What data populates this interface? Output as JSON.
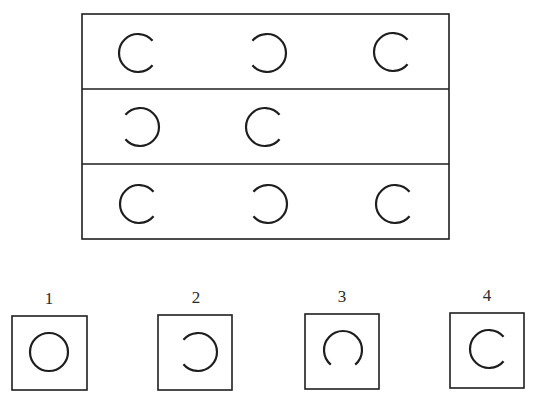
{
  "puzzle": {
    "type": "matrix-completion",
    "stroke_color": "#1e1e1e",
    "background": "#ffffff",
    "matrix": {
      "box": {
        "x": 82,
        "y": 14,
        "width": 367,
        "height": 225
      },
      "dividers_y": [
        89,
        164
      ],
      "rows": [
        {
          "cells": [
            {
              "shape": "circle-open-right",
              "cx": 138,
              "cy": 53,
              "r": 19
            },
            {
              "shape": "circle-open-left",
              "cx": 267,
              "cy": 53,
              "r": 19
            },
            {
              "shape": "circle-open-right",
              "cx": 393,
              "cy": 52,
              "r": 19
            }
          ]
        },
        {
          "cells": [
            {
              "shape": "circle-open-left",
              "cx": 140,
              "cy": 127,
              "r": 19
            },
            {
              "shape": "circle-open-right",
              "cx": 265,
              "cy": 127,
              "r": 19
            },
            {
              "shape": "empty",
              "cx": 393,
              "cy": 127,
              "r": 19
            }
          ]
        },
        {
          "cells": [
            {
              "shape": "circle-open-right",
              "cx": 139,
              "cy": 204,
              "r": 19
            },
            {
              "shape": "circle-open-left",
              "cx": 268,
              "cy": 204,
              "r": 19
            },
            {
              "shape": "circle-open-right",
              "cx": 395,
              "cy": 204,
              "r": 19
            }
          ]
        }
      ]
    },
    "options": [
      {
        "label": "1",
        "shape": "circle-closed",
        "box": {
          "x": 12,
          "y": 316,
          "width": 75,
          "height": 74
        },
        "label_x": 49,
        "label_y": 290,
        "cx": 49,
        "cy": 352,
        "r": 19
      },
      {
        "label": "2",
        "shape": "circle-open-left",
        "box": {
          "x": 158,
          "y": 315,
          "width": 74,
          "height": 75
        },
        "label_x": 196,
        "label_y": 289,
        "cx": 198,
        "cy": 352,
        "r": 19
      },
      {
        "label": "3",
        "shape": "circle-open-bottom",
        "box": {
          "x": 305,
          "y": 314,
          "width": 74,
          "height": 75
        },
        "label_x": 342,
        "label_y": 288,
        "cx": 343,
        "cy": 350,
        "r": 19
      },
      {
        "label": "4",
        "shape": "circle-open-right",
        "box": {
          "x": 450,
          "y": 313,
          "width": 74,
          "height": 75
        },
        "label_x": 487,
        "label_y": 287,
        "cx": 489,
        "cy": 349,
        "r": 19
      }
    ]
  }
}
